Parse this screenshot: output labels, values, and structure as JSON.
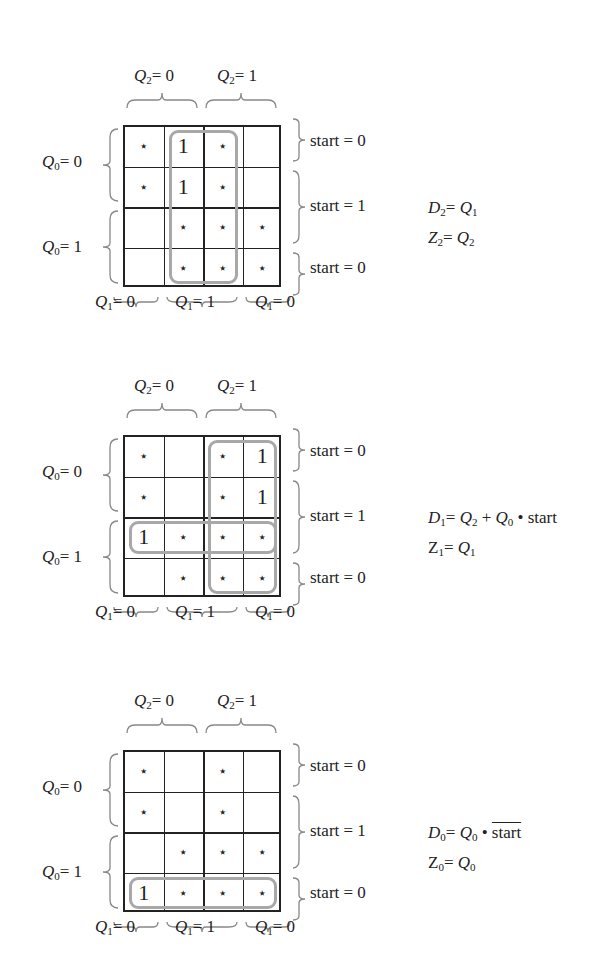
{
  "labels": {
    "q2_0": "= 0",
    "q2_1": "= 1",
    "q0_0": "= 0",
    "q0_1": "= 1",
    "q1_0": "= 0",
    "q1_1": "= 1",
    "start_0": "start = 0",
    "start_1": "start = 1"
  },
  "maps": [
    {
      "id": "D2",
      "cells": [
        [
          "*",
          "1",
          "*",
          ""
        ],
        [
          "*",
          "1",
          "*",
          ""
        ],
        [
          "",
          "*",
          "*",
          "*"
        ],
        [
          "",
          "*",
          "*",
          "*"
        ]
      ],
      "equations": [
        {
          "lhs": "D",
          "lhs_sub": "2",
          "rhs": "Q",
          "rhs_sub": "1"
        },
        {
          "lhs": "Z",
          "lhs_sub": "2",
          "rhs": "Q",
          "rhs_sub": "2"
        }
      ]
    },
    {
      "id": "D1",
      "cells": [
        [
          "*",
          "",
          "*",
          "1"
        ],
        [
          "*",
          "",
          "*",
          "1"
        ],
        [
          "1",
          "*",
          "*",
          "*"
        ],
        [
          "",
          "*",
          "*",
          "*"
        ]
      ],
      "equations": [
        {
          "text": "D1 = Q2 + Q0 · start"
        },
        {
          "lhs": "Z",
          "lhs_sub": "1",
          "rhs": "Q",
          "rhs_sub": "1"
        }
      ]
    },
    {
      "id": "D0",
      "cells": [
        [
          "*",
          "",
          "*",
          ""
        ],
        [
          "*",
          "",
          "*",
          ""
        ],
        [
          "",
          "*",
          "*",
          "*"
        ],
        [
          "1",
          "*",
          "*",
          "*"
        ]
      ],
      "equations": [
        {
          "text": "D0 = Q0 · start̅"
        },
        {
          "lhs": "Z",
          "lhs_sub": "0",
          "rhs": "Q",
          "rhs_sub": "0"
        }
      ]
    }
  ],
  "colors": {
    "grid": "#222222",
    "loop": "#a8a8a8",
    "background": "#ffffff"
  }
}
